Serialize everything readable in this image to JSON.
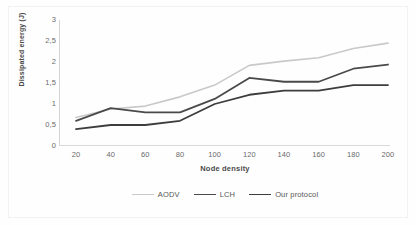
{
  "chart_data": {
    "type": "line",
    "title": "",
    "xlabel": "Node density",
    "ylabel": "Dissipated energy (J)",
    "x": [
      20,
      40,
      60,
      80,
      100,
      120,
      140,
      160,
      180,
      200
    ],
    "xtick_labels": [
      "20",
      "40",
      "60",
      "80",
      "100",
      "120",
      "140",
      "160",
      "180",
      "200"
    ],
    "ytick_labels": [
      "0",
      "0,5",
      "1",
      "1,5",
      "2",
      "2,5",
      "3"
    ],
    "ytick_values": [
      0,
      0.5,
      1,
      1.5,
      2,
      2.5,
      3
    ],
    "xlim": [
      20,
      200
    ],
    "ylim": [
      0,
      3
    ],
    "grid": false,
    "legend_position": "bottom",
    "series": [
      {
        "name": "AODV",
        "color": "#c9c9c9",
        "width": 1.6,
        "values": [
          0.68,
          0.88,
          0.95,
          1.17,
          1.45,
          1.92,
          2.02,
          2.1,
          2.32,
          2.45
        ]
      },
      {
        "name": "LCH",
        "color": "#4a4a4a",
        "width": 1.8,
        "values": [
          0.6,
          0.9,
          0.8,
          0.8,
          1.12,
          1.62,
          1.53,
          1.53,
          1.84,
          1.94
        ]
      },
      {
        "name": "Our protocol",
        "color": "#3d3d3d",
        "width": 1.8,
        "values": [
          0.4,
          0.5,
          0.5,
          0.6,
          1.0,
          1.22,
          1.32,
          1.32,
          1.45,
          1.45
        ]
      }
    ]
  }
}
